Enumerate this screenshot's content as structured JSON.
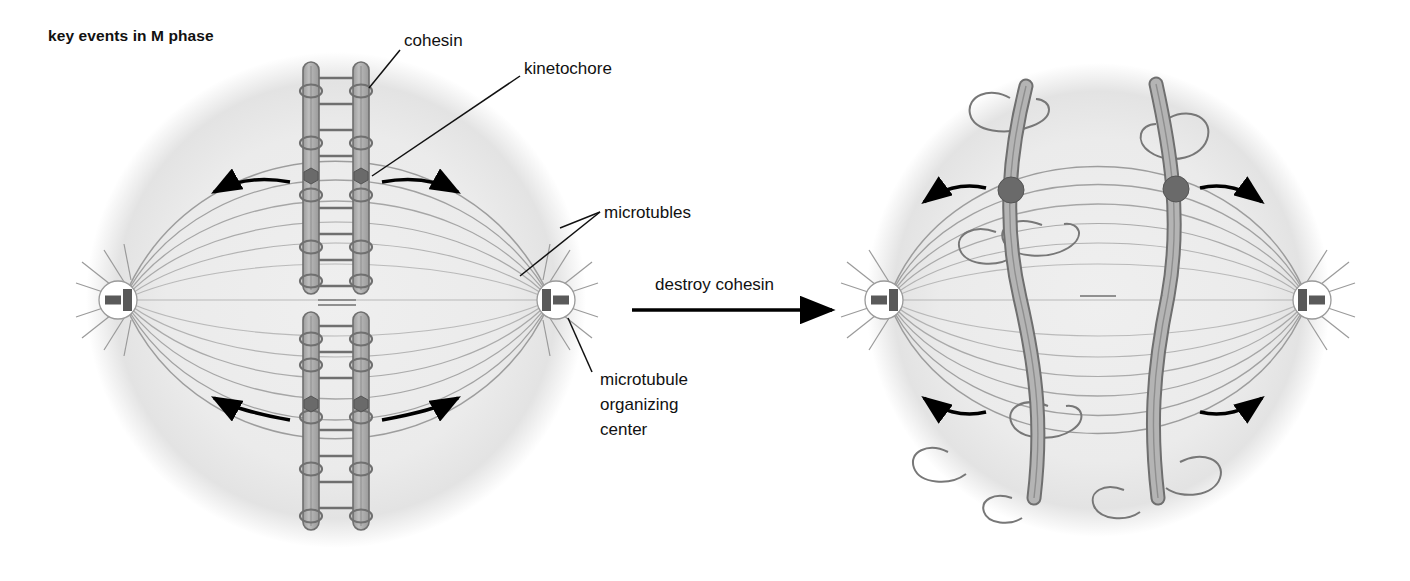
{
  "figure": {
    "title": "key events in M phase",
    "kind": "biology-diagram"
  },
  "transition": {
    "label": "destroy cohesin",
    "arrow": "right-arrow"
  },
  "labels": {
    "cohesin": "cohesin",
    "kinetochore": "kinetochore",
    "microtubules": "microtubles",
    "mtoc_line1": "microtubule",
    "mtoc_line2": "organizing",
    "mtoc_line3": "center"
  },
  "panels": [
    {
      "id": "before",
      "name": "metaphase-cell",
      "state": "sister chromatids held together by cohesin",
      "poles": 2,
      "chromosome_pairs": 2,
      "kinetochores": 4,
      "cohesin_rings_per_chromosome": 6,
      "free_cohesin_rings": 0
    },
    {
      "id": "after",
      "name": "anaphase-cell",
      "state": "sister chromatids separated, cohesin released",
      "poles": 2,
      "chromosome_pairs": 2,
      "kinetochores": 4,
      "cohesin_rings_per_chromosome": 0,
      "free_cohesin_rings": 8
    }
  ],
  "colors": {
    "cell_fill": "#ededed",
    "cell_edge": "#d8d8d8",
    "chromatid_fill": "#a8a8a8",
    "chromatid_edge": "#6f6f6f",
    "kinetochore": "#6a6a6a",
    "cohesin_ring": "#707070",
    "microtubule": "#8a8a8a",
    "mtoc_body": "#ffffff",
    "centriole": "#555555",
    "arrow": "#000000",
    "text": "#111111"
  }
}
